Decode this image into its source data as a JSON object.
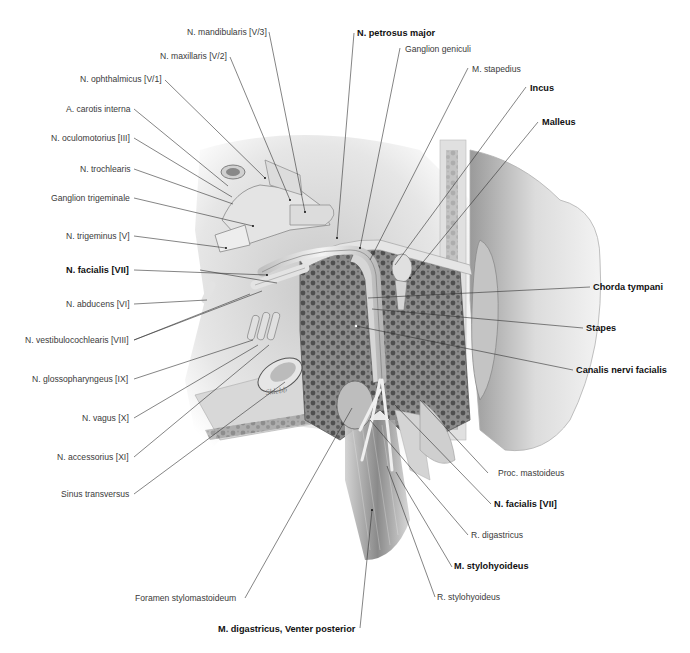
{
  "figure": {
    "signature": "Sklebb",
    "colors": {
      "background": "#ffffff",
      "label_text": "#3a3a3a",
      "label_bold": "#111111",
      "leader_line": "#333333",
      "bone_dark": "#6d6d6d",
      "bone_light": "#dcdcdc"
    },
    "labels_left": [
      {
        "text": "N. mandibularis [V/3]",
        "bold": false
      },
      {
        "text": "N. maxillaris [V/2]",
        "bold": false
      },
      {
        "text": "N. ophthalmicus [V/1]",
        "bold": false
      },
      {
        "text": "A. carotis interna",
        "bold": false
      },
      {
        "text": "N. oculomotorius [III]",
        "bold": false
      },
      {
        "text": "N. trochlearis",
        "bold": false
      },
      {
        "text": "Ganglion trigeminale",
        "bold": false
      },
      {
        "text": "N. trigeminus [V]",
        "bold": false
      },
      {
        "text": "N. facialis [VII]",
        "bold": true
      },
      {
        "text": "N. abducens [VI]",
        "bold": false
      },
      {
        "text": "N. vestibulocochlearis [VIII]",
        "bold": false
      },
      {
        "text": "N. glossopharyngeus [IX]",
        "bold": false
      },
      {
        "text": "N. vagus [X]",
        "bold": false
      },
      {
        "text": "N. accessorius [XI]",
        "bold": false
      },
      {
        "text": "Sinus transversus",
        "bold": false
      },
      {
        "text": "Foramen stylomastoideum",
        "bold": false
      }
    ],
    "labels_top": [
      {
        "text": "N. petrosus major",
        "bold": true
      },
      {
        "text": "Ganglion geniculi",
        "bold": false
      },
      {
        "text": "M. stapedius",
        "bold": false
      },
      {
        "text": "Incus",
        "bold": true
      },
      {
        "text": "Malleus",
        "bold": true
      }
    ],
    "labels_right": [
      {
        "text": "Chorda tympani",
        "bold": true
      },
      {
        "text": "Stapes",
        "bold": true
      },
      {
        "text": "Canalis nervi facialis",
        "bold": true
      },
      {
        "text": "Proc. mastoideus",
        "bold": false
      },
      {
        "text": "N. facialis [VII]",
        "bold": true
      },
      {
        "text": "R. digastricus",
        "bold": false
      },
      {
        "text": "M. stylohyoideus",
        "bold": true
      },
      {
        "text": "R. stylohyoideus",
        "bold": false
      }
    ],
    "labels_bottom": [
      {
        "text": "M. digastricus, Venter posterior",
        "bold": true
      }
    ]
  }
}
